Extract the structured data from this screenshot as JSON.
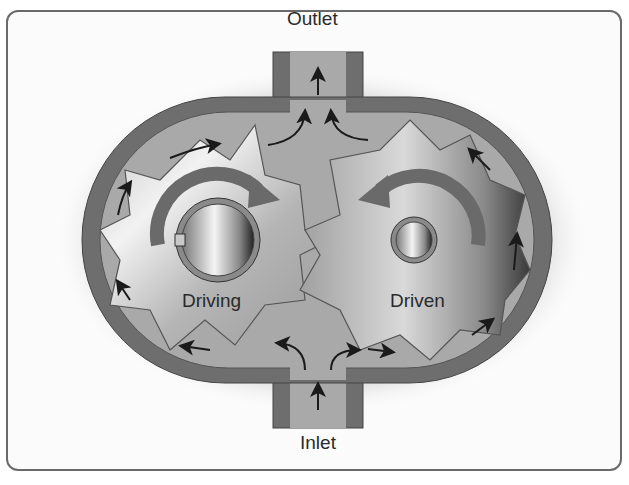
{
  "diagram": {
    "labels": {
      "outlet": "Outlet",
      "inlet": "Inlet",
      "driving": "Driving",
      "driven": "Driven"
    },
    "colors": {
      "housing": "#6e6e6e",
      "chamber": "#a9a9a9",
      "gear_light": "#d8d8d8",
      "gear_dark": "#8a8a8a",
      "arrow": "#1a1a1a",
      "rotation_arrow": "#6a6a6a",
      "frame": "#6a6a6a"
    },
    "components": [
      "housing",
      "driving gear",
      "driven gear",
      "outlet port",
      "inlet port",
      "flow arrows",
      "rotation arrows"
    ]
  }
}
